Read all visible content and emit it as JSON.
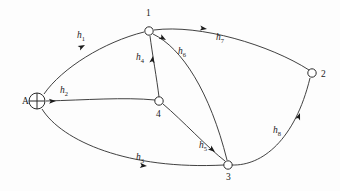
{
  "figure": {
    "type": "directed-graph",
    "background": "#fdfdfd",
    "stroke_color": "#2b2b2b",
    "text_color": "#1a1a1a"
  },
  "nodes": [
    {
      "id": "A",
      "label": "A",
      "shape": "crossed-circle",
      "x": 37,
      "y": 101,
      "r": 8,
      "label_x": 22,
      "label_y": 104
    },
    {
      "id": "1",
      "label": "1",
      "shape": "circle",
      "x": 149,
      "y": 31,
      "r": 4.2,
      "label_x": 146,
      "label_y": 16
    },
    {
      "id": "2",
      "label": "2",
      "shape": "circle",
      "x": 312,
      "y": 73,
      "r": 4.2,
      "label_x": 321,
      "label_y": 77
    },
    {
      "id": "3",
      "label": "3",
      "shape": "circle",
      "x": 228,
      "y": 165,
      "r": 4.2,
      "label_x": 226,
      "label_y": 180
    },
    {
      "id": "4",
      "label": "4",
      "shape": "circle",
      "x": 159,
      "y": 101,
      "r": 4.2,
      "label_x": 156,
      "label_y": 117
    }
  ],
  "edges": [
    {
      "id": "h1",
      "from": "A",
      "to": "1",
      "base": "h",
      "sub": "1",
      "label_x": 77,
      "label_y": 38,
      "path": "M 44 94 C 62 68, 104 42, 144 32",
      "arrow_x": 85,
      "arrow_y": 45,
      "arrow_rot": -28
    },
    {
      "id": "h2",
      "from": "A",
      "to": "4",
      "base": "h",
      "sub": "2",
      "label_x": 60,
      "label_y": 93,
      "path": "M 46 101 C 85 100, 125 97, 155 100",
      "arrow_x": 56,
      "arrow_y": 101,
      "arrow_rot": -2
    },
    {
      "id": "h3",
      "from": "A",
      "to": "3",
      "base": "h",
      "sub": "3",
      "label_x": 136,
      "label_y": 160,
      "path": "M 42 109 C 62 141, 128 170, 224 165",
      "arrow_x": 147,
      "arrow_y": 166,
      "arrow_rot": 5
    },
    {
      "id": "h4",
      "from": "4",
      "to": "1",
      "base": "h",
      "sub": "4",
      "label_x": 136,
      "label_y": 60,
      "path": "M 159 97 C 157 80, 152 52, 150 36",
      "arrow_x": 153,
      "arrow_y": 56,
      "arrow_rot": -81
    },
    {
      "id": "h5",
      "from": "4",
      "to": "3",
      "base": "h",
      "sub": "5",
      "label_x": 199,
      "label_y": 148,
      "path": "M 163 104 C 182 120, 208 148, 225 161",
      "arrow_x": 215,
      "arrow_y": 152,
      "arrow_rot": 40
    },
    {
      "id": "h6",
      "from": "1",
      "to": "3",
      "base": "h",
      "sub": "6",
      "label_x": 178,
      "label_y": 54,
      "path": "M 153 34 C 182 48, 210 92, 227 160",
      "arrow_x": 166,
      "arrow_y": 40,
      "arrow_rot": 30
    },
    {
      "id": "h7",
      "from": "1",
      "to": "2",
      "base": "h",
      "sub": "7",
      "label_x": 216,
      "label_y": 40,
      "path": "M 154 30 C 200 24, 270 45, 309 70",
      "arrow_x": 207,
      "arrow_y": 29,
      "arrow_rot": 8
    },
    {
      "id": "h8",
      "from": "3",
      "to": "2",
      "base": "h",
      "sub": "8",
      "label_x": 273,
      "label_y": 133,
      "path": "M 232 165 C 262 166, 295 140, 310 78",
      "arrow_x": 300,
      "arrow_y": 113,
      "arrow_rot": -70
    }
  ]
}
